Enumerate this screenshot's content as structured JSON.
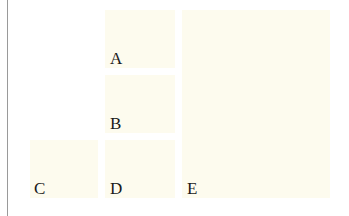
{
  "diagram": {
    "background": "#ffffff",
    "box_color": "#fdfbee",
    "boxes": [
      {
        "id": "A",
        "label": "A"
      },
      {
        "id": "B",
        "label": "B"
      },
      {
        "id": "C",
        "label": "C"
      },
      {
        "id": "D",
        "label": "D"
      },
      {
        "id": "E",
        "label": "E"
      }
    ]
  }
}
